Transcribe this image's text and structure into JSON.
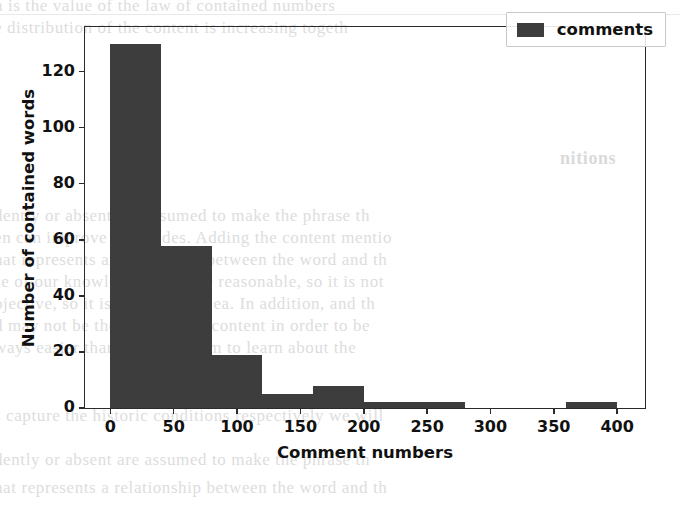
{
  "chart_data": {
    "type": "bar",
    "title": "",
    "xlabel": "Comment numbers",
    "ylabel": "Number of contained words",
    "xlim": [
      -20,
      422
    ],
    "ylim": [
      0,
      136
    ],
    "grid": false,
    "legend": {
      "position": "upper right",
      "entries": [
        "comments"
      ]
    },
    "series": [
      {
        "name": "comments",
        "color": "#3d3d3d",
        "bin_edges": [
          0,
          40,
          80,
          120,
          160,
          200,
          240,
          280,
          320,
          360,
          400
        ],
        "values": [
          130,
          58,
          19,
          5,
          8,
          2,
          2,
          0,
          0,
          2
        ]
      }
    ],
    "xticks": [
      0,
      50,
      100,
      150,
      200,
      250,
      300,
      350,
      400
    ],
    "xtick_labels": [
      "0",
      "50",
      "100",
      "150",
      "200",
      "250",
      "300",
      "350",
      "400"
    ],
    "yticks": [
      0,
      20,
      40,
      60,
      80,
      100,
      120
    ],
    "ytick_labels": [
      "0",
      "20",
      "40",
      "60",
      "80",
      "100",
      "120"
    ]
  },
  "legend": {
    "label": "comments",
    "swatch_color": "#3d3d3d"
  },
  "axes": {
    "xlabel": "Comment numbers",
    "ylabel": "Number of contained words",
    "frame_color": "#2b2b2b"
  },
  "page_bleed": {
    "heading": "nitions",
    "lines": [
      "n  is   the   value  of  the  law  of  contained  numbers",
      "e  distribution   of   the  content  is  increasing  togeth",
      "dently or  absent   are  assumed  to  make  the  phrase  th",
      "en  can  improve  both  sides.  Adding  the  content  mentio",
      "hat  represents   a  relationship  between  the  word  and  th",
      "se  of  our  knowledge  are  more  reasonable,  so  it  is  not",
      "bjective,  so  it  is  not  a  good  idea.  In  addition,  and  th",
      "d  may  not  be  the  same  as  the  content  in  order  to  be",
      "ways  easier   than   them.   We  aim  to  learn  about  the",
      "s  capture  the  historic  conditions  respectively  we  will"
    ]
  }
}
